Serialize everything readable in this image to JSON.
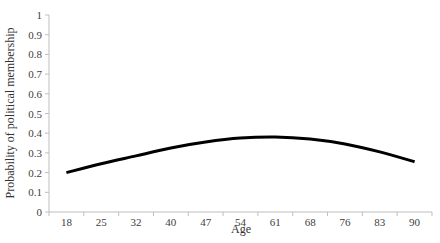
{
  "chart_data": {
    "type": "line",
    "title": "",
    "xlabel": "Age",
    "ylabel": "Probability of political membership",
    "categories": [
      "18",
      "25",
      "32",
      "40",
      "47",
      "54",
      "61",
      "68",
      "76",
      "83",
      "90"
    ],
    "series": [
      {
        "name": "Probability of political membership",
        "values": [
          0.2,
          0.245,
          0.285,
          0.325,
          0.355,
          0.375,
          0.38,
          0.37,
          0.345,
          0.305,
          0.255
        ],
        "color": "#000000"
      }
    ],
    "ylim": [
      0,
      1
    ],
    "yticks": [
      "0",
      "0.1",
      "0.2",
      "0.3",
      "0.4",
      "0.5",
      "0.6",
      "0.7",
      "0.8",
      "0.9",
      "1"
    ],
    "grid": false,
    "legend": "none"
  },
  "colors": {
    "axis": "#bfbfbf",
    "line": "#000000",
    "text": "#404040"
  }
}
